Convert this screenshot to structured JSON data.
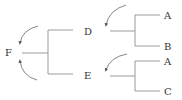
{
  "diagram": {
    "type": "tree",
    "colors": {
      "line": "#9a9a9a",
      "arrow": "#777777",
      "text": "#333333"
    },
    "nodes": {
      "F": {
        "label": "F"
      },
      "D": {
        "label": "D"
      },
      "E": {
        "label": "E"
      },
      "D_child_1": {
        "label": "A"
      },
      "D_child_2": {
        "label": "B"
      },
      "E_child_1": {
        "label": "A"
      },
      "E_child_2": {
        "label": "C"
      }
    },
    "edges": [
      {
        "from": "F",
        "to": "D"
      },
      {
        "from": "F",
        "to": "E"
      },
      {
        "from": "D",
        "to": "A"
      },
      {
        "from": "D",
        "to": "B"
      },
      {
        "from": "E",
        "to": "A"
      },
      {
        "from": "E",
        "to": "C"
      }
    ],
    "rotation_arrows": [
      {
        "node": "F",
        "direction": "counterclockwise-upper"
      },
      {
        "node": "F",
        "direction": "clockwise-lower"
      },
      {
        "node": "D",
        "direction": "counterclockwise"
      },
      {
        "node": "E",
        "direction": "counterclockwise"
      }
    ]
  }
}
